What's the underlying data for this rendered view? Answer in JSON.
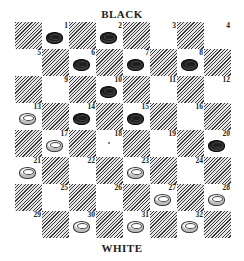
{
  "labels": {
    "top": "BLACK",
    "bottom": "WHITE"
  },
  "colors": {
    "black_piece": "#1e1e1e",
    "white_piece": "#f4f4f4",
    "dark_square_hatch": "#3a3a3a"
  },
  "board": {
    "size": 8,
    "playable_squares": "light",
    "squares": [
      {
        "n": 1,
        "piece": "black"
      },
      {
        "n": 2,
        "piece": "black"
      },
      {
        "n": 3,
        "piece": null
      },
      {
        "n": 4,
        "piece": null
      },
      {
        "n": 5,
        "piece": null
      },
      {
        "n": 6,
        "piece": "black"
      },
      {
        "n": 7,
        "piece": "black"
      },
      {
        "n": 8,
        "piece": "black"
      },
      {
        "n": 9,
        "piece": null
      },
      {
        "n": 10,
        "piece": "black"
      },
      {
        "n": 11,
        "piece": null
      },
      {
        "n": 12,
        "piece": null
      },
      {
        "n": 13,
        "piece": "white"
      },
      {
        "n": 14,
        "piece": "black"
      },
      {
        "n": 15,
        "piece": "black"
      },
      {
        "n": 16,
        "piece": null
      },
      {
        "n": 17,
        "piece": "white"
      },
      {
        "n": 18,
        "piece": null,
        "marker": "dot"
      },
      {
        "n": 19,
        "piece": null
      },
      {
        "n": 20,
        "piece": "black"
      },
      {
        "n": 21,
        "piece": "white"
      },
      {
        "n": 22,
        "piece": null
      },
      {
        "n": 23,
        "piece": "white"
      },
      {
        "n": 24,
        "piece": null
      },
      {
        "n": 25,
        "piece": null
      },
      {
        "n": 26,
        "piece": null
      },
      {
        "n": 27,
        "piece": "white"
      },
      {
        "n": 28,
        "piece": "white"
      },
      {
        "n": 29,
        "piece": null
      },
      {
        "n": 30,
        "piece": "white"
      },
      {
        "n": 31,
        "piece": "white"
      },
      {
        "n": 32,
        "piece": "white"
      }
    ]
  },
  "pieces": {
    "black": [
      1,
      2,
      6,
      7,
      8,
      10,
      14,
      15,
      20
    ],
    "white": [
      13,
      17,
      21,
      23,
      27,
      28,
      30,
      31,
      32
    ]
  }
}
